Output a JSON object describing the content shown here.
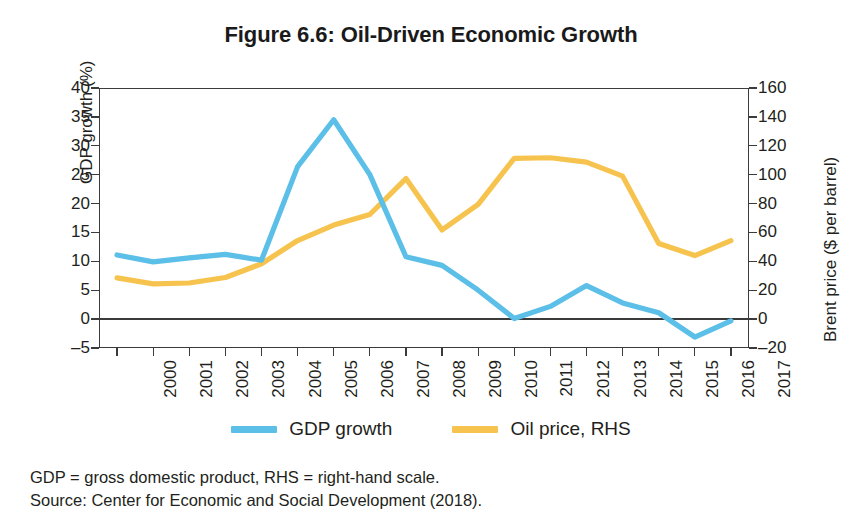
{
  "figure": {
    "title": "Figure 6.6: Oil-Driven Economic Growth"
  },
  "legend": {
    "items": [
      {
        "label": "GDP growth",
        "color": "#5bbfe8"
      },
      {
        "label": "Oil price, RHS",
        "color": "#f6c44e"
      }
    ]
  },
  "footnotes": {
    "definitions": "GDP = gross domestic product, RHS = right-hand scale.",
    "source": "Source: Center for Economic and Social Development (2018)."
  },
  "colors": {
    "gdp_growth": "#5bbfe8",
    "oil_price": "#f6c44e",
    "axis": "#3b3b3b",
    "text": "#231f20",
    "background": "#ffffff"
  },
  "chart_data": {
    "type": "line",
    "title": "Figure 6.6: Oil-Driven Economic Growth",
    "xlabel": "",
    "ylabel": "GDP growth (%)",
    "y2label": "Brent price ($ per barrel)",
    "grid": false,
    "legend_position": "bottom",
    "x": [
      2000,
      2001,
      2002,
      2003,
      2004,
      2005,
      2006,
      2007,
      2008,
      2009,
      2010,
      2011,
      2012,
      2013,
      2014,
      2015,
      2016,
      2017
    ],
    "categories": [
      "2000",
      "2001",
      "2002",
      "2003",
      "2004",
      "2005",
      "2006",
      "2007",
      "2008",
      "2009",
      "2010",
      "2011",
      "2012",
      "2013",
      "2014",
      "2015",
      "2016",
      "2017"
    ],
    "ylim": [
      -5,
      40
    ],
    "yticks": [
      40,
      35,
      30,
      25,
      20,
      15,
      10,
      5,
      0,
      -5
    ],
    "y2lim": [
      -20,
      160
    ],
    "y2ticks": [
      160,
      140,
      120,
      100,
      80,
      60,
      40,
      20,
      0,
      -20
    ],
    "series": [
      {
        "name": "GDP growth",
        "axis": "left",
        "color": "#5bbfe8",
        "units": "%",
        "values": [
          11.1,
          9.9,
          10.6,
          11.2,
          10.2,
          26.4,
          34.5,
          25.0,
          10.8,
          9.3,
          5.0,
          0.1,
          2.2,
          5.8,
          2.8,
          1.1,
          -3.1,
          -0.3
        ]
      },
      {
        "name": "Oil price, RHS",
        "axis": "right",
        "color": "#f6c44e",
        "units": "$ per barrel",
        "values": [
          28.5,
          24.4,
          25.0,
          28.8,
          38.3,
          54.4,
          65.1,
          72.4,
          97.3,
          61.7,
          79.5,
          111.3,
          111.7,
          108.7,
          99.0,
          52.4,
          44.0,
          54.3
        ]
      }
    ]
  }
}
